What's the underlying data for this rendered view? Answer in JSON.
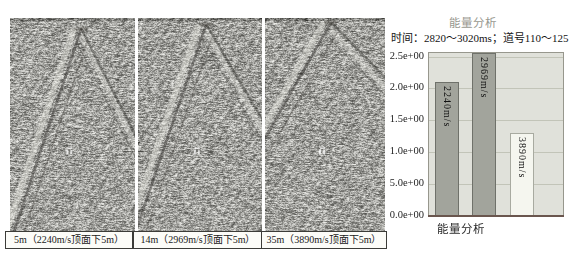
{
  "figure": {
    "background": "#ffffff"
  },
  "panels": [
    {
      "caption": "5m（2240m/s顶面下5m）"
    },
    {
      "caption": "14m（2969m/s顶面下5m）"
    },
    {
      "caption": "35m（3890m/s顶面下5m）"
    }
  ],
  "chart": {
    "title": "能量分析",
    "subtitle": "时间：2820～3020ms；道号110～125",
    "xlabel": "能量分析"
  },
  "chart_data": {
    "type": "bar",
    "title": "能量分析",
    "subtitle": "时间：2820～3020ms；道号110～125",
    "xlabel": "能量分析",
    "ylabel": "",
    "categories": [
      "2240m/s",
      "2969m/s",
      "3890m/s"
    ],
    "values": [
      2.1,
      2.55,
      1.3
    ],
    "ylim": [
      0,
      2.55
    ],
    "grid": true,
    "legend": false,
    "yticks": [
      {
        "value": 0.0,
        "label": "0.0e+00"
      },
      {
        "value": 0.5,
        "label": "5.0e+00"
      },
      {
        "value": 1.0,
        "label": "1.0e+00"
      },
      {
        "value": 1.5,
        "label": "1.5e+00"
      },
      {
        "value": 2.0,
        "label": "2.0e+00"
      },
      {
        "value": 2.5,
        "label": "2.5e+00"
      }
    ],
    "bar_colors": [
      "#a2a49c",
      "#a2a49c",
      "#f5f6ef"
    ],
    "bar_borders": [
      "#6f716a",
      "#6f716a",
      "#a8aaa0"
    ],
    "plot_bg": "#e0e1da",
    "grid_color": "#c2c4b8",
    "axis_color": "#6a564e"
  }
}
